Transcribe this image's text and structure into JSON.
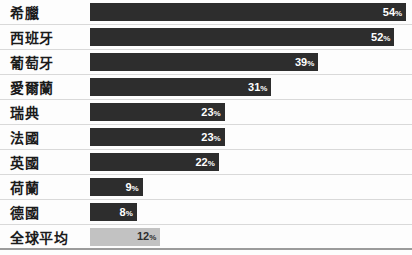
{
  "chart_data": {
    "type": "bar",
    "orientation": "horizontal",
    "title": "",
    "categories": [
      "希臘",
      "西班牙",
      "葡萄牙",
      "愛爾蘭",
      "瑞典",
      "法國",
      "英國",
      "荷蘭",
      "德國",
      "全球平均"
    ],
    "values": [
      54,
      52,
      39,
      31,
      23,
      23,
      22,
      9,
      8,
      12
    ],
    "value_labels": [
      "54%",
      "52%",
      "39%",
      "31%",
      "23%",
      "23%",
      "22%",
      "9%",
      "8%",
      "12%"
    ],
    "unit": "%",
    "xlim": [
      0,
      55
    ],
    "grid": "horizontal-row-separators",
    "legend": "none",
    "highlight_category": "全球平均",
    "colors": {
      "bar": "#2d2d2d",
      "highlight_bar": "#c2c2c2",
      "value_on_dark_bar": "#ffffff",
      "value_on_light_bar": "#2d2d2d",
      "label_text": "#1b1b1b",
      "row_separator": "#d9d9d9",
      "baseline": "#9b9b9b",
      "background": "#fdfdfd"
    }
  }
}
